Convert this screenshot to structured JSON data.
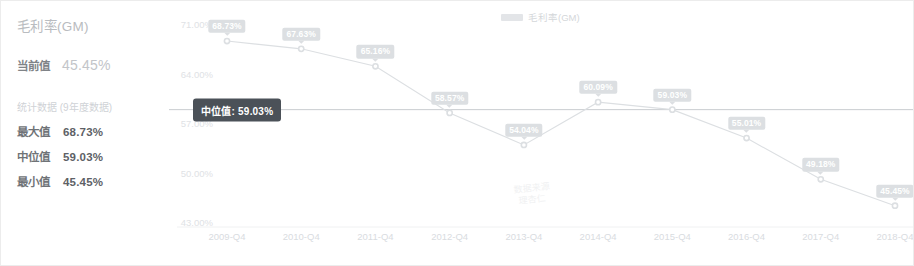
{
  "panel": {
    "title": "毛利率(GM)",
    "current_label": "当前值",
    "current_value": "45.45%",
    "stats_caption": "统计数据 (9年度数据)",
    "stats": [
      {
        "label": "最大值",
        "value": "68.73%"
      },
      {
        "label": "中位值",
        "value": "59.03%"
      },
      {
        "label": "最小值",
        "value": "45.45%"
      }
    ]
  },
  "legend": {
    "label": "毛利率(GM)",
    "color": "#e3e5e8"
  },
  "median_line": {
    "tooltip": "中位值: 59.03%",
    "value": 59.03,
    "color": "#c9ccd0"
  },
  "watermark": "数据来源\n理杏仁",
  "chart_data": {
    "type": "line",
    "title": "毛利率(GM)",
    "xlabel": "",
    "ylabel": "",
    "categories": [
      "2009-Q4",
      "2010-Q4",
      "2011-Q4",
      "2012-Q4",
      "2013-Q4",
      "2014-Q4",
      "2015-Q4",
      "2016-Q4",
      "2017-Q4",
      "2018-Q4"
    ],
    "series": [
      {
        "name": "毛利率(GM)",
        "values": [
          68.73,
          67.63,
          65.16,
          58.57,
          54.04,
          60.09,
          59.03,
          55.01,
          49.18,
          45.45
        ],
        "labels": [
          "68.73%",
          "67.63%",
          "65.16%",
          "58.57%",
          "54.04%",
          "60.09%",
          "59.03%",
          "55.01%",
          "49.18%",
          "45.45%"
        ],
        "color": "#dcdfe2"
      }
    ],
    "ylim": [
      43,
      71
    ],
    "yticks": [
      71,
      64,
      57,
      50,
      43
    ],
    "ytick_labels": [
      "71.00%",
      "64.00%",
      "57.00%",
      "50.00%",
      "43.00%"
    ],
    "grid": false,
    "legend_position": "top-center",
    "annotations": [
      {
        "type": "hline",
        "value": 59.03,
        "label": "中位值: 59.03%"
      }
    ]
  }
}
